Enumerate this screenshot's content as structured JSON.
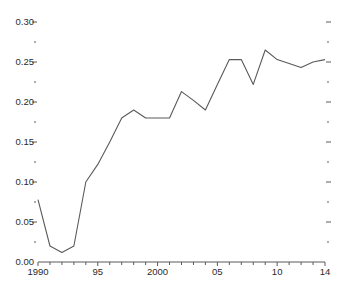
{
  "chart_data": {
    "type": "line",
    "title": "",
    "subtitle": "",
    "xlabel": "",
    "ylabel": "",
    "x": [
      1990,
      1991,
      1992,
      1993,
      1994,
      1995,
      1996,
      1997,
      1998,
      1999,
      2000,
      2001,
      2002,
      2003,
      2004,
      2005,
      2006,
      2007,
      2008,
      2009,
      2010,
      2011,
      2012,
      2013,
      2014
    ],
    "values": [
      0.078,
      0.02,
      0.012,
      0.02,
      0.1,
      0.122,
      0.15,
      0.18,
      0.19,
      0.18,
      0.18,
      0.18,
      0.213,
      0.202,
      0.19,
      0.222,
      0.253,
      0.253,
      0.222,
      0.265,
      0.253,
      0.248,
      0.243,
      0.25,
      0.253
    ],
    "series": [
      {
        "name": "",
        "values": [
          0.078,
          0.02,
          0.012,
          0.02,
          0.1,
          0.122,
          0.15,
          0.18,
          0.19,
          0.18,
          0.18,
          0.18,
          0.213,
          0.202,
          0.19,
          0.222,
          0.253,
          0.253,
          0.222,
          0.265,
          0.253,
          0.248,
          0.243,
          0.25,
          0.253
        ]
      }
    ],
    "xlim": [
      1990,
      2014
    ],
    "ylim": [
      0.0,
      0.3
    ],
    "y_major_ticks": [
      0.0,
      0.05,
      0.1,
      0.15,
      0.2,
      0.25,
      0.3
    ],
    "y_minor_ticks": [
      0.025,
      0.075,
      0.125,
      0.175,
      0.225,
      0.275
    ],
    "y_tick_labels": [
      "0.00",
      "0.05",
      "0.10",
      "0.15",
      "0.20",
      "0.25",
      "0.30"
    ],
    "x_tick_years": [
      1990,
      1991,
      1992,
      1993,
      1994,
      1995,
      1996,
      1997,
      1998,
      1999,
      2000,
      2001,
      2002,
      2003,
      2004,
      2005,
      2006,
      2007,
      2008,
      2009,
      2010,
      2011,
      2012,
      2013,
      2014
    ],
    "x_labeled_years": [
      1990,
      1995,
      2000,
      2005,
      2010,
      2014
    ],
    "x_tick_labels": [
      "1990",
      "95",
      "2000",
      "05",
      "10",
      "14"
    ],
    "grid": false,
    "legend": "none",
    "line_color": "#5a5a5a",
    "text_color": "#2b2b2b",
    "axis_color": "#5a5a5a",
    "background_color": "#ffffff",
    "right_axis_ticks": true,
    "annotations": []
  }
}
